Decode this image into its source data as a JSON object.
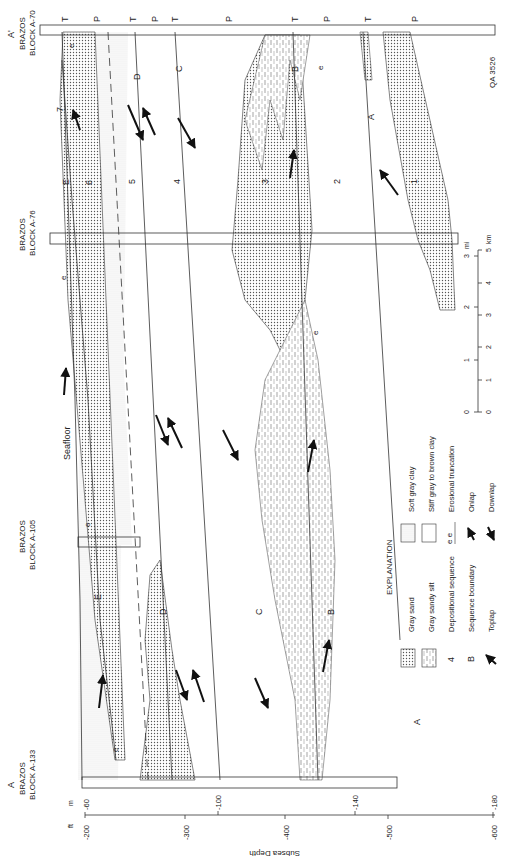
{
  "figure_id": "QA 3526",
  "section": {
    "end_a_prime": {
      "letter": "A'",
      "label1": "BRAZOS",
      "label2": "BLOCK  A-70"
    },
    "end_a": {
      "letter": "A",
      "label1": "BRAZOS",
      "label2": "BLOCK  A-133"
    },
    "wells": [
      {
        "label1": "BRAZOS",
        "label2": "BLOCK  A-76"
      },
      {
        "label1": "BRAZOS",
        "label2": "BLOCK  A-105"
      }
    ],
    "seafloor_label": "Seafloor",
    "top_markers": [
      "T",
      "P",
      "T",
      "P",
      "T",
      "P",
      "T",
      "P",
      "T",
      "P"
    ],
    "sequence_numbers": [
      "1",
      "2",
      "3",
      "4",
      "5",
      "6",
      "7"
    ],
    "boundary_letters": [
      "A",
      "B",
      "C",
      "D",
      "E"
    ],
    "erosion_mark": "e"
  },
  "depth_axis": {
    "title": "Subsea Depth",
    "unit_ft": "ft",
    "unit_m": "m",
    "ft_ticks": [
      "-200",
      "-300",
      "-400",
      "-500",
      "-600"
    ],
    "m_ticks": [
      "-60",
      "-100",
      "-140",
      "-180"
    ]
  },
  "scale_bar": {
    "mi_label": "mi",
    "km_label": "km",
    "mi_ticks": [
      "0",
      "1",
      "2",
      "3"
    ],
    "km_ticks": [
      "0",
      "1",
      "2",
      "3",
      "4",
      "5"
    ]
  },
  "explanation": {
    "title": "EXPLANATION",
    "items": [
      {
        "symbol": "gray-sand",
        "label": "Gray sand"
      },
      {
        "symbol": "gray-sandy-silt",
        "label": "Gray sandy silt"
      },
      {
        "symbol": "4",
        "label": "Depositional sequence"
      },
      {
        "symbol": "B",
        "label": "Sequence boundary"
      },
      {
        "symbol": "toplap",
        "label": "Toplap"
      },
      {
        "symbol": "soft-gray-clay",
        "label": "Soft gray clay"
      },
      {
        "symbol": "stiff-clay",
        "label": "Stiff gray to brown clay"
      },
      {
        "symbol": "e  e",
        "label": "Erosional truncation"
      },
      {
        "symbol": "onlap",
        "label": "Onlap"
      },
      {
        "symbol": "downlap",
        "label": "Downlap"
      }
    ]
  }
}
